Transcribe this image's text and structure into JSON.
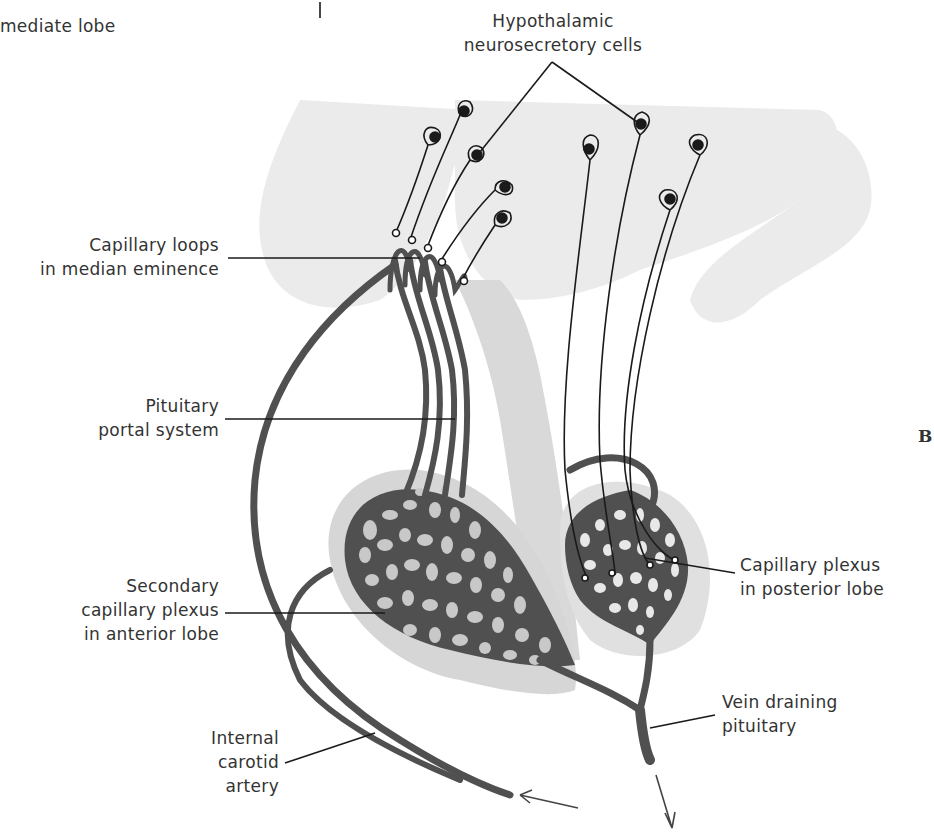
{
  "figure": {
    "panel_letter": "B",
    "colors": {
      "vessel": "#505050",
      "background_tissue": "#e6e6e6",
      "lobe_outline": "#d2d2d2",
      "lumen": "#c8c8c8",
      "neuron_stroke": "#1a1a1a",
      "label_text": "#333333"
    }
  },
  "labels": {
    "intermediate_lobe": "mediate lobe",
    "hypothalamic": {
      "line1": "Hypothalamic",
      "line2": "neurosecretory cells"
    },
    "capillary_loops": {
      "line1": "Capillary loops",
      "line2": "in median eminence"
    },
    "portal_system": {
      "line1": "Pituitary",
      "line2": "portal system"
    },
    "secondary_plexus": {
      "line1": "Secondary",
      "line2": "capillary plexus",
      "line3": "in anterior lobe"
    },
    "internal_carotid": {
      "line1": "Internal",
      "line2": "carotid",
      "line3": "artery"
    },
    "posterior_plexus": {
      "line1": "Capillary plexus",
      "line2": "in posterior lobe"
    },
    "vein_draining": {
      "line1": "Vein draining",
      "line2": "pituitary"
    }
  }
}
